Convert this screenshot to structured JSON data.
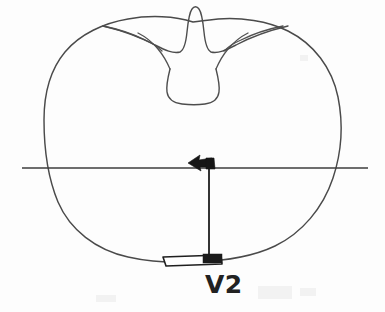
{
  "figure": {
    "kind": "anatomical-line-drawing",
    "background_color": "#fdfdfd",
    "ink_color": "#4a4a4a",
    "marker_color": "#161616"
  },
  "labels": {
    "transducer_label": "V2"
  },
  "annotations": {
    "horizontal_reference_line": {
      "name": "horizontal-reference-line",
      "x_start": 22,
      "x_end": 368,
      "y": 168
    },
    "vertical_beam_line": {
      "name": "vertical-beam-line",
      "x": 209,
      "y_start": 166,
      "y_end": 259
    },
    "arrow": {
      "name": "left-pointing-arrow",
      "direction": "left",
      "tip_x": 189,
      "tip_y": 163,
      "tail_x": 215,
      "tail_y": 163
    },
    "transducer": {
      "name": "ultrasound-transducer",
      "center_x": 192,
      "center_y": 261,
      "width": 60,
      "height": 9
    }
  },
  "structures": {
    "body_outline": "heart-shaped vertebral body cross-section",
    "spinous_process": "narrow central spike at superior midline",
    "transverse_processes": "paired thin lateral wings",
    "vertebral_canal": "central triangular canal below spinous process"
  }
}
